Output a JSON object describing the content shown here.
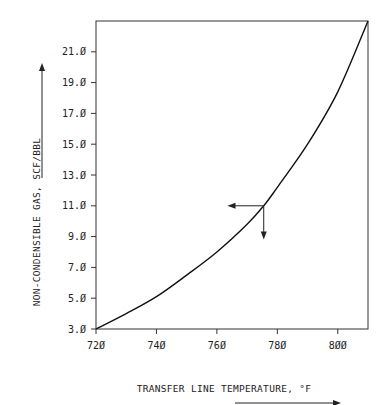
{
  "chart_data": {
    "type": "line",
    "title": "",
    "xlabel": "TRANSFER LINE TEMPERATURE, °F",
    "ylabel": "NON-CONDENSIBLE GAS, SCF/BBL",
    "xlim": [
      720,
      810
    ],
    "ylim": [
      3.0,
      23.0
    ],
    "xticks": [
      "720",
      "740",
      "760",
      "780",
      "800"
    ],
    "yticks": [
      "3.0",
      "5.0",
      "7.0",
      "9.0",
      "11.0",
      "13.0",
      "15.0",
      "17.0",
      "19.0",
      "21.0"
    ],
    "grid": false,
    "series": [
      {
        "name": "Non-condensible gas",
        "x": [
          720,
          730,
          740,
          750,
          760,
          770,
          775.5,
          780,
          790,
          800,
          810
        ],
        "y": [
          3.0,
          4.0,
          5.1,
          6.5,
          8.0,
          9.8,
          11.0,
          12.2,
          15.0,
          18.4,
          23.0
        ]
      }
    ],
    "annotations": [
      {
        "type": "arrow-left",
        "from": [
          775.5,
          11.0
        ],
        "to": [
          765.5,
          11.0
        ]
      },
      {
        "type": "arrow-down",
        "from": [
          775.5,
          11.0
        ],
        "to": [
          775.5,
          9.2
        ]
      }
    ]
  },
  "labels": {
    "x_axis": "TRANSFER LINE TEMPERATURE, °F",
    "y_axis": "NON-CONDENSIBLE GAS, SCF/BBL"
  }
}
